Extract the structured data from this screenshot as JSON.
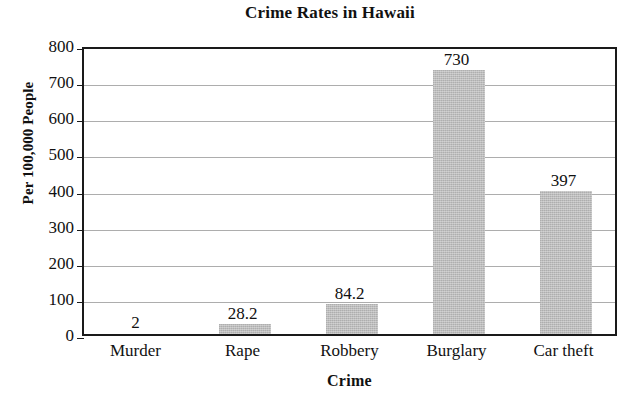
{
  "chart_data": {
    "type": "bar",
    "title": "Crime Rates in Hawaii",
    "xlabel": "Crime",
    "ylabel": "Per 100,000 People",
    "categories": [
      "Murder",
      "Rape",
      "Robbery",
      "Burglary",
      "Car theft"
    ],
    "values": [
      2,
      28.2,
      84.2,
      730,
      397
    ],
    "value_labels": [
      "2",
      "28.2",
      "84.2",
      "730",
      "397"
    ],
    "ylim": [
      0,
      800
    ],
    "ytick_values": [
      0,
      100,
      200,
      300,
      400,
      500,
      600,
      700,
      800
    ],
    "ytick_labels": [
      "0",
      "100",
      "200",
      "300",
      "400",
      "500",
      "600",
      "700",
      "800"
    ],
    "grid": "horizontal",
    "legend": "none",
    "bar_color": "#b6b6b6",
    "axis_color": "#1a1a1a",
    "gridline_color": "#adadad",
    "background_color": "#ffffff"
  }
}
